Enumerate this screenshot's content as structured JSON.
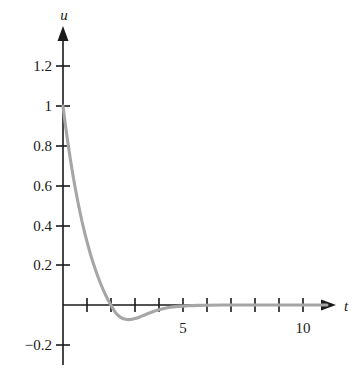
{
  "chart_data": {
    "type": "line",
    "title": "",
    "subtitle": "",
    "xlabel": "t",
    "ylabel": "u",
    "xlim": [
      -0.15,
      11.4
    ],
    "ylim": [
      -0.28,
      1.38
    ],
    "grid": false,
    "legend": null,
    "x_ticks": [
      1,
      2,
      3,
      4,
      5,
      6,
      7,
      8,
      9,
      10
    ],
    "x_tick_labels": [
      "",
      "",
      "",
      "",
      "5",
      "",
      "",
      "",
      "",
      "10"
    ],
    "y_ticks": [
      -0.2,
      0.2,
      0.4,
      0.6,
      0.8,
      1,
      1.2
    ],
    "y_tick_labels": [
      "−0.2",
      "0.2",
      "0.4",
      "0.6",
      "0.8",
      "1",
      "1.2"
    ],
    "series": [
      {
        "name": "u(t)",
        "color": "#a6a6a6",
        "x": [
          0.0,
          0.1,
          0.2,
          0.3,
          0.4,
          0.5,
          0.6,
          0.7,
          0.8,
          0.9,
          1.0,
          1.1,
          1.2,
          1.3,
          1.4,
          1.5,
          1.6,
          1.7,
          1.8,
          1.9,
          2.0,
          2.2,
          2.4,
          2.6,
          2.8,
          3.0,
          3.2,
          3.4,
          3.6,
          3.8,
          4.0,
          4.4,
          4.8,
          5.2,
          5.6,
          6.0,
          7.0,
          8.0,
          9.0,
          10.0,
          11.0
        ],
        "y": [
          1.0,
          0.905,
          0.818,
          0.737,
          0.663,
          0.594,
          0.53,
          0.471,
          0.416,
          0.365,
          0.318,
          0.274,
          0.233,
          0.196,
          0.161,
          0.128,
          0.098,
          0.07,
          0.044,
          0.02,
          -0.002,
          -0.04,
          -0.062,
          -0.072,
          -0.073,
          -0.068,
          -0.06,
          -0.05,
          -0.04,
          -0.031,
          -0.024,
          -0.013,
          -0.007,
          -0.004,
          -0.002,
          -0.001,
          0.0,
          0.0,
          0.0,
          0.0,
          0.0
        ]
      }
    ],
    "annotations": []
  },
  "axes": {
    "y_axis_label": "u",
    "x_axis_label": "t"
  },
  "colors": {
    "curve": "#a6a6a6",
    "axis": "#1a1a1a",
    "background": "#ffffff"
  }
}
